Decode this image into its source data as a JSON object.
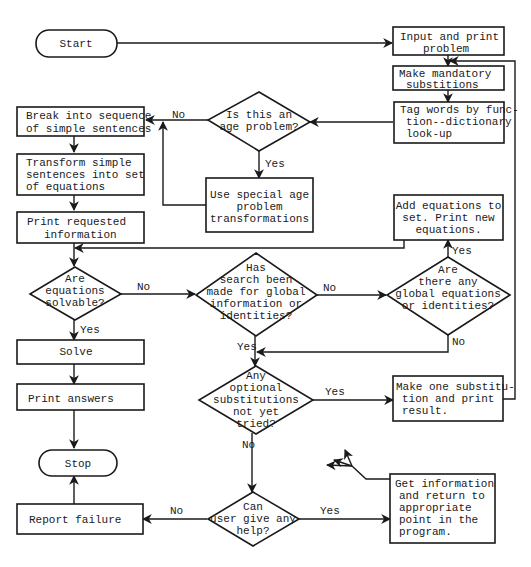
{
  "diagram": {
    "type": "flowchart",
    "terminals": {
      "start": "Start",
      "stop": "Stop"
    },
    "processes": {
      "input_print": [
        "Input and print",
        "problem"
      ],
      "mandatory_subs": [
        "Make mandatory",
        "substitions"
      ],
      "tag_words": [
        "Tag words by func-",
        "tion--dictionary",
        "look-up"
      ],
      "break_sentences": [
        "Break into sequence",
        "of simple sentences"
      ],
      "transform": [
        "Transform simple",
        "sentences into set",
        "of equations"
      ],
      "print_requested": [
        "Print requested",
        "information"
      ],
      "age_transform": [
        "Use special age",
        "problem",
        "transformations"
      ],
      "add_equations": [
        "Add equations to",
        "set. Print new",
        "equations."
      ],
      "solve": [
        "Solve"
      ],
      "print_answers": [
        "Print answers"
      ],
      "one_substitution": [
        "Make one substitu-",
        "tion and print",
        "result."
      ],
      "report_failure": [
        "Report failure"
      ],
      "get_information": [
        "Get information",
        "and return to",
        "appropriate",
        "point in the",
        "program."
      ]
    },
    "decisions": {
      "age_problem": [
        "Is this an",
        "age problem?"
      ],
      "solvable": [
        "Are",
        "equations",
        "solvable?"
      ],
      "search_made": [
        "Has",
        "search been",
        "made for global",
        "information or",
        "identities?"
      ],
      "global_eq": [
        "Are",
        "there any",
        "global equations",
        "or identities?"
      ],
      "optional_subs": [
        "Any",
        "optional",
        "substitutions",
        "not yet",
        "tried?"
      ],
      "user_help": [
        "Can",
        "user give any",
        "help?"
      ]
    },
    "edge_labels": {
      "age_no": "No",
      "age_yes": "Yes",
      "solvable_no": "No",
      "solvable_yes": "Yes",
      "search_no": "No",
      "search_yes": "Yes",
      "global_yes": "Yes",
      "global_no": "No",
      "optional_yes": "Yes",
      "optional_no": "No",
      "help_no": "No",
      "help_yes": "Yes"
    },
    "colors": {
      "ink": "#1a1a1a",
      "paper": "#ffffff"
    }
  }
}
